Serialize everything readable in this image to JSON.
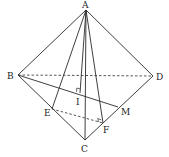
{
  "diagram": {
    "type": "geometry-tetrahedron",
    "points": {
      "A": {
        "label": "A",
        "x": 86,
        "y": 10
      },
      "B": {
        "label": "B",
        "x": 18,
        "y": 75
      },
      "C": {
        "label": "C",
        "x": 85,
        "y": 140
      },
      "D": {
        "label": "D",
        "x": 153,
        "y": 76
      },
      "E": {
        "label": "E",
        "x": 52,
        "y": 109
      },
      "F": {
        "label": "F",
        "x": 103,
        "y": 123
      },
      "M": {
        "label": "M",
        "x": 118,
        "y": 107
      },
      "I": {
        "label": "I",
        "x": 80,
        "y": 96
      }
    },
    "solid_segments": [
      "AB",
      "AD",
      "AC",
      "BC",
      "CD",
      "AE",
      "AF",
      "AI",
      "BM"
    ],
    "dashed_segments": [
      "BD",
      "EF"
    ],
    "right_angles": [
      "I",
      "F"
    ],
    "labels": {
      "A": "A",
      "B": "B",
      "C": "C",
      "D": "D",
      "E": "E",
      "F": "F",
      "M": "M",
      "I": "I"
    }
  }
}
